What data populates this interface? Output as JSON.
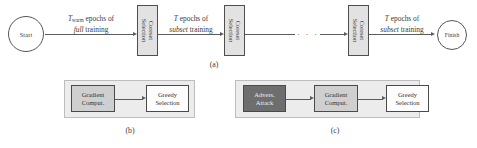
{
  "figure": {
    "panels": [
      {
        "id": "a",
        "caption": "(a)",
        "start_node": {
          "label": "Start",
          "icon": "start-circle"
        },
        "finish_node": {
          "label": "Finish",
          "icon": "finish-circle"
        },
        "module_label_line1": "Coreset",
        "module_label_line2": "Selection",
        "modules": [
          {
            "label_line1": "Coreset",
            "label_line2": "Selection"
          },
          {
            "label_line1": "Coreset",
            "label_line2": "Selection"
          },
          {
            "label_line1": "Coreset",
            "label_line2": "Selection"
          }
        ],
        "edges": [
          {
            "name": "warmup-edge",
            "line1_prefix": "T",
            "line1_sub": "warm",
            "line1_suffix": " epochs of",
            "line2_italic": "full",
            "line2_suffix": " training"
          },
          {
            "name": "subset-edge-1",
            "line1_prefix": "T",
            "line1_sub": "",
            "line1_suffix": " epochs of",
            "line2_italic": "subset",
            "line2_suffix": " training"
          },
          {
            "name": "subset-edge-last",
            "line1_prefix": "T",
            "line1_sub": "",
            "line1_suffix": " epochs of",
            "line2_italic": "subset",
            "line2_suffix": " training"
          }
        ],
        "ellipsis": "· · ·"
      },
      {
        "id": "b",
        "caption": "(b)",
        "stages": [
          {
            "line1": "Gradient",
            "line2": "Comput.",
            "tone": "mid"
          },
          {
            "line1": "Greedy",
            "line2": "Selection",
            "tone": "light"
          }
        ]
      },
      {
        "id": "c",
        "caption": "(c)",
        "stages": [
          {
            "line1": "Advers.",
            "line2": "Attack",
            "tone": "dark"
          },
          {
            "line1": "Gradient",
            "line2": "Comput.",
            "tone": "mid"
          },
          {
            "line1": "Greedy",
            "line2": "Selection",
            "tone": "light"
          }
        ]
      }
    ]
  },
  "colors": {
    "stroke": "#5c5c5c",
    "module_fill": "#e2e2e2",
    "panel_fill": "#ececec",
    "tone_dark": "#6e6e6e",
    "tone_mid": "#cfcfcf",
    "tone_light": "#fdfdfd",
    "text": "#3a3a3a"
  }
}
